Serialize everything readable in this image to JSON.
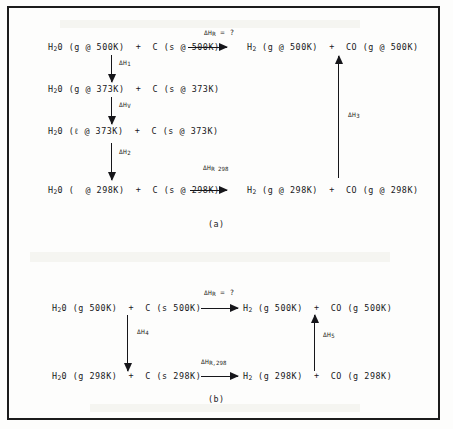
{
  "figure": {
    "title_caption_a": "(a)",
    "title_caption_b": "(b)",
    "ink_color": "#16161a",
    "background_color": "#fdfdfc"
  },
  "panel_a": {
    "caption": "(a)",
    "rows": [
      {
        "id": "row-500k",
        "left_reactants": "H²0 (g @ 500K)  +  C (s @ 500K)",
        "right_products": "H² (g @ 500K)  +  CO (g @ 500K)",
        "arrow_label_delta": "ΔH",
        "arrow_label_sub": "R",
        "arrow_label_tail": " = ?"
      },
      {
        "id": "row-373k-gas",
        "left_reactants": "H²0 (g @ 373K)  +  C (s @ 373K)",
        "right_products": "",
        "arrow_label_delta": "",
        "arrow_label_sub": "",
        "arrow_label_tail": ""
      },
      {
        "id": "row-373k-liquid",
        "left_reactants": "H²0 (ℓ @ 373K)  +  C (s @ 373K)",
        "right_products": "",
        "arrow_label_delta": "",
        "arrow_label_sub": "",
        "arrow_label_tail": ""
      },
      {
        "id": "row-298k",
        "left_reactants": "H²0 (  @ 298K)  +  C (s @ 298K)",
        "right_products": "H² (g @ 298K)  +  CO (g @ 298K)",
        "arrow_label_delta": "ΔH",
        "arrow_label_sub": "R 298",
        "arrow_label_tail": ""
      }
    ],
    "row1_left": "H",
    "enthalpy_steps": [
      {
        "id": "dh1",
        "delta": "ΔH",
        "sub": "1",
        "direction": "down"
      },
      {
        "id": "dhv",
        "delta": "ΔH",
        "sub": "V",
        "direction": "down"
      },
      {
        "id": "dh2",
        "delta": "ΔH",
        "sub": "2",
        "direction": "down"
      },
      {
        "id": "dh3",
        "delta": "ΔH",
        "sub": "3",
        "direction": "up"
      }
    ]
  },
  "panel_b": {
    "caption": "(b)",
    "rows": [
      {
        "id": "row-500k",
        "left_reactants": "H²0 (g 500K)  +  C (s 500K)",
        "right_products": "H² (g 500K)  +  CO (g 500K)",
        "arrow_label_delta": "ΔH",
        "arrow_label_sub": "R",
        "arrow_label_tail": " = ?"
      },
      {
        "id": "row-298k",
        "left_reactants": "H²0 (g 298K)  +  C (s 298K)",
        "right_products": "H² (g 298K)  +  CO (g 298K)",
        "arrow_label_delta": "ΔH",
        "arrow_label_sub": "R,298",
        "arrow_label_tail": ""
      }
    ],
    "enthalpy_steps": [
      {
        "id": "dh4",
        "delta": "ΔH",
        "sub": "4",
        "direction": "down"
      },
      {
        "id": "dh5",
        "delta": "ΔH",
        "sub": "5",
        "direction": "up"
      }
    ]
  },
  "text": {
    "a_r1_left": "H",
    "a_r1_left_sub": "2",
    "a_r1_left_rest": "0 (g @ 500K)  +  C (s @ 500K)",
    "a_r1_right_head": "H",
    "a_r1_right_sub": "2",
    "a_r1_right_rest": " (g @ 500K)  +  CO (g @ 500K)",
    "a_r2_left_rest": "0 (g @ 373K)  +  C (s @ 373K)",
    "a_r3_left_rest": "0 (ℓ @ 373K)  +  C (s @ 373K)",
    "a_r4_left_rest": "0 (  @ 298K)  +  C (s @ 298K)",
    "a_r4_right_rest": " (g @ 298K)  +  CO (g @ 298K)",
    "b_r1_left_rest": "0 (g 500K)  +  C (s 500K)",
    "b_r1_right_rest": " (g 500K)  +  CO (g 500K)",
    "b_r2_left_rest": "0 (g 298K)  +  C (s 298K)",
    "b_r2_right_rest": " (g 298K)  +  CO (g 298K)",
    "delta": "ΔH",
    "sub_R": "R",
    "tail_eq_q": " = ?",
    "sub_R298_a": "R 298",
    "sub_R298_b": "R,298",
    "sub_1": "1",
    "sub_V": "V",
    "sub_2": "2",
    "sub_3": "3",
    "sub_4": "4",
    "sub_5": "5",
    "caption_a": "(a)",
    "caption_b": "(b)"
  }
}
